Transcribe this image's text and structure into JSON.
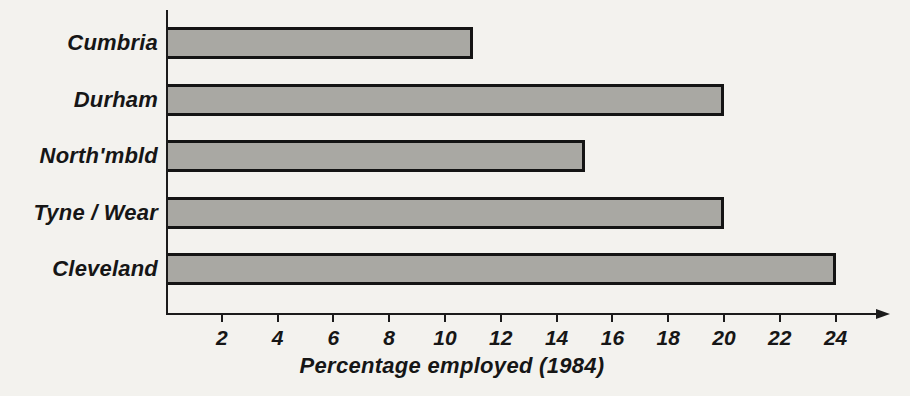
{
  "chart_data": {
    "type": "bar",
    "orientation": "horizontal",
    "categories": [
      "Cumbria",
      "Durham",
      "North'mbld",
      "Tyne / Wear",
      "Cleveland"
    ],
    "values": [
      11,
      20,
      15,
      20,
      24
    ],
    "title": "",
    "xlabel": "Percentage employed (1984)",
    "ylabel": "",
    "xlim": [
      0,
      25.5
    ],
    "xticks": [
      2,
      4,
      6,
      8,
      10,
      12,
      14,
      16,
      18,
      20,
      22,
      24
    ],
    "grid": "off",
    "legend": "none",
    "bar_fill_color": "#a9a8a3",
    "bar_border_color": "#141414",
    "axis_color": "#1b1b1b",
    "background_color": "#f3f2ee"
  }
}
